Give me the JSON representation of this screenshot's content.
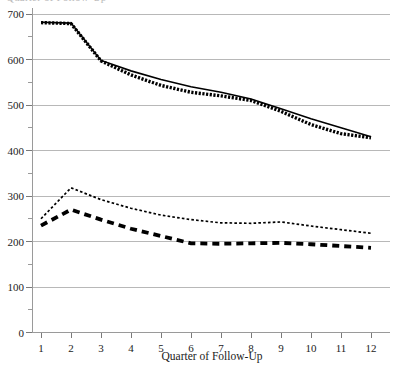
{
  "chart_data": {
    "type": "line",
    "title": "",
    "cropped_top_label": "Quarter of Follow-Up",
    "xlabel": "Quarter of Follow-Up",
    "ylabel": "",
    "x": [
      1,
      2,
      3,
      4,
      5,
      6,
      7,
      8,
      9,
      10,
      11,
      12
    ],
    "xticklabels": [
      "1",
      "2",
      "3",
      "4",
      "5",
      "6",
      "7",
      "8",
      "9",
      "10",
      "11",
      "12"
    ],
    "yticklabels": [
      "0",
      "100",
      "200",
      "300",
      "400",
      "500",
      "600",
      "700"
    ],
    "ytickvalues": [
      0,
      100,
      200,
      300,
      400,
      500,
      600,
      700
    ],
    "xlim": [
      0.5,
      12.5
    ],
    "ylim": [
      0,
      700
    ],
    "grid": true,
    "grid_axis": "y",
    "legend": "none",
    "series": [
      {
        "name": "upper-solid",
        "style": "solid",
        "values": [
          682,
          680,
          598,
          575,
          556,
          540,
          528,
          513,
          492,
          470,
          450,
          430
        ]
      },
      {
        "name": "upper-dotted",
        "style": "dotted-thick",
        "values": [
          681,
          679,
          597,
          566,
          543,
          528,
          520,
          510,
          486,
          457,
          437,
          428
        ]
      },
      {
        "name": "lower-dotted",
        "style": "dotted-fine",
        "values": [
          250,
          318,
          292,
          273,
          258,
          248,
          241,
          240,
          243,
          234,
          226,
          218
        ]
      },
      {
        "name": "lower-dashed",
        "style": "dashed-thick",
        "values": [
          235,
          270,
          248,
          228,
          212,
          196,
          195,
          196,
          197,
          194,
          190,
          186
        ]
      }
    ]
  },
  "axis": {
    "x_title": "Quarter of Follow-Up"
  },
  "colors": {
    "series": "#000000",
    "grid": "#b8b8b8",
    "axis": "#9a9a9a",
    "text": "#1a1a1a",
    "background": "#ffffff"
  }
}
